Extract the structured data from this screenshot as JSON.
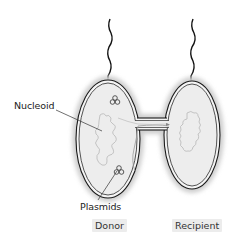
{
  "figure": {
    "type": "bacterial-conjugation-diagram",
    "labels": {
      "nucleoid": "Nucleoid",
      "plasmids": "Plasmids"
    },
    "captions": {
      "donor": "Donor",
      "recipient": "Recipient"
    },
    "colors": {
      "cell_fill": "#eeeeee",
      "capsule_halo": "#d4d4d4",
      "membrane": "#1a1a1a",
      "dna": "#bdbdbd",
      "caption_bg": "#ececec"
    }
  }
}
